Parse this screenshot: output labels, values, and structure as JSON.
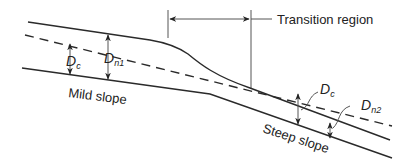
{
  "diagram": {
    "title_label": "Transition region",
    "mild_slope_label": "Mild slope",
    "steep_slope_label": "Steep slope",
    "symbols": {
      "critical_depth_mild": {
        "base": "D",
        "sub": "c"
      },
      "normal_depth_mild": {
        "base": "D",
        "sub": "n1"
      },
      "critical_depth_steep": {
        "base": "D",
        "sub": "c"
      },
      "normal_depth_steep": {
        "base": "D",
        "sub": "n2"
      }
    },
    "legend": {
      "solid_line": "water surface / channel bed",
      "dashed_line": "critical depth line"
    }
  }
}
